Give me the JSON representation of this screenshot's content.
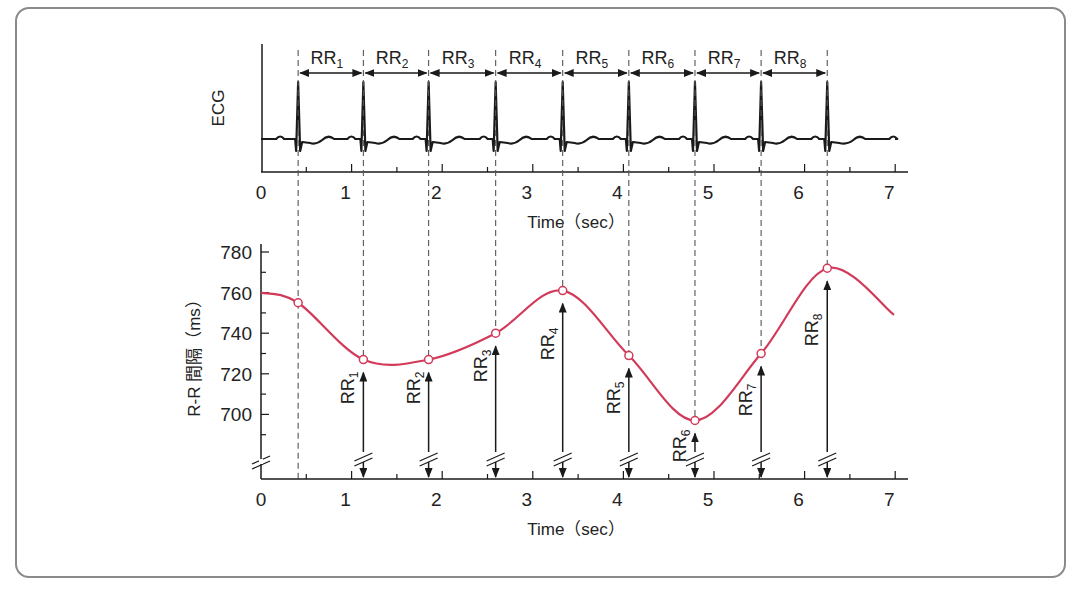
{
  "chart_data": [
    {
      "type": "line",
      "title": "",
      "panel": "ECG",
      "ylabel": "ECG",
      "xlabel": "Time (sec)",
      "xlim": [
        0,
        7
      ],
      "x_ticks": [
        "0",
        "1",
        "2",
        "3",
        "4",
        "5",
        "6",
        "7"
      ],
      "r_peak_times_sec": [
        0.41,
        1.13,
        1.85,
        2.59,
        3.33,
        4.06,
        4.79,
        5.52,
        6.25
      ],
      "intervals": [
        "RR1",
        "RR2",
        "RR3",
        "RR4",
        "RR5",
        "RR6",
        "RR7",
        "RR8"
      ],
      "annotations": [
        "RR1",
        "RR2",
        "RR3",
        "RR4",
        "RR5",
        "RR6",
        "RR7",
        "RR8"
      ],
      "grid": false
    },
    {
      "type": "line",
      "title": "",
      "panel": "R-R interval",
      "ylabel": "R-R 間隔 (ms)",
      "xlabel": "Time (sec)",
      "xlim": [
        0,
        7
      ],
      "ylim": [
        680,
        785
      ],
      "x_ticks": [
        "0",
        "1",
        "2",
        "3",
        "4",
        "5",
        "6",
        "7"
      ],
      "y_ticks": [
        "700",
        "720",
        "740",
        "760",
        "780"
      ],
      "axis_break": true,
      "series": [
        {
          "name": "R-R interval tachogram",
          "color": "#d23a5a",
          "x": [
            0.41,
            1.13,
            1.85,
            2.59,
            3.33,
            4.06,
            4.79,
            5.52,
            6.25
          ],
          "values": [
            755,
            727,
            727,
            740,
            761,
            729,
            697,
            730,
            772
          ],
          "labels": [
            "",
            "RR1",
            "RR2",
            "RR3",
            "RR4",
            "RR5",
            "RR6",
            "RR7",
            "RR8"
          ]
        }
      ],
      "curve_start": {
        "x": 0,
        "y": 760
      },
      "curve_end": {
        "x": 7,
        "y": 749
      },
      "grid": false
    }
  ],
  "top_panel": {
    "ylabel": "ECG",
    "xlabel": "Time（sec）",
    "xticks": [
      "0",
      "1",
      "2",
      "3",
      "4",
      "5",
      "6",
      "7"
    ],
    "rr_labels": [
      {
        "main": "RR",
        "sub": "1"
      },
      {
        "main": "RR",
        "sub": "2"
      },
      {
        "main": "RR",
        "sub": "3"
      },
      {
        "main": "RR",
        "sub": "4"
      },
      {
        "main": "RR",
        "sub": "5"
      },
      {
        "main": "RR",
        "sub": "6"
      },
      {
        "main": "RR",
        "sub": "7"
      },
      {
        "main": "RR",
        "sub": "8"
      }
    ]
  },
  "bottom_panel": {
    "ylabel": "R-R 間隔（ms）",
    "xlabel": "Time（sec）",
    "xticks": [
      "0",
      "1",
      "2",
      "3",
      "4",
      "5",
      "6",
      "7"
    ],
    "yticks": [
      "780",
      "760",
      "740",
      "720",
      "700"
    ],
    "rr_labels": [
      {
        "main": "RR",
        "sub": "1"
      },
      {
        "main": "RR",
        "sub": "2"
      },
      {
        "main": "RR",
        "sub": "3"
      },
      {
        "main": "RR",
        "sub": "4"
      },
      {
        "main": "RR",
        "sub": "5"
      },
      {
        "main": "RR",
        "sub": "6"
      },
      {
        "main": "RR",
        "sub": "7"
      },
      {
        "main": "RR",
        "sub": "8"
      }
    ]
  },
  "colors": {
    "curve": "#d23a5a",
    "ink": "#1a1a1a",
    "frame": "#8a8a8a",
    "dash": "#555555"
  }
}
